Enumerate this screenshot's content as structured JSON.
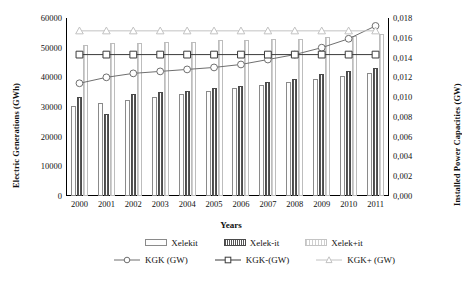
{
  "chart_data": {
    "type": "bar",
    "title": "",
    "xlabel": "Years",
    "ylabel": "Electric Generations (GWh)",
    "y2label": "Installed Power Capacities (GW)",
    "categories": [
      "2000",
      "2001",
      "2002",
      "2003",
      "2004",
      "2005",
      "2006",
      "2007",
      "2008",
      "2009",
      "2010",
      "2011"
    ],
    "ylim": [
      0,
      60000
    ],
    "y2lim": [
      0,
      0.018
    ],
    "y_ticks": [
      "0",
      "10000",
      "20000",
      "30000",
      "40000",
      "50000",
      "60000"
    ],
    "y2_ticks": [
      "0,000",
      "0,002",
      "0,004",
      "0,006",
      "0,008",
      "0,010",
      "0,012",
      "0,014",
      "0,016",
      "0,018"
    ],
    "grid": false,
    "legend_position": "bottom",
    "decimal_separator": ",",
    "bar_series": [
      {
        "name": "Xelekit",
        "axis": "left",
        "fill": "speckled",
        "values": [
          30500,
          31500,
          32500,
          33500,
          34500,
          35500,
          36500,
          37500,
          38500,
          39500,
          40500,
          41500
        ]
      },
      {
        "name": "Xelek-it",
        "axis": "left",
        "fill": "dark-hatch",
        "values": [
          33500,
          27500,
          34500,
          35000,
          35500,
          36500,
          37000,
          38500,
          39500,
          41000,
          42000,
          43000
        ]
      },
      {
        "name": "Xelek+it",
        "axis": "left",
        "fill": "light-hatch",
        "values": [
          51000,
          51500,
          51500,
          52000,
          52000,
          52500,
          52500,
          53000,
          53000,
          53500,
          54000,
          54500
        ]
      }
    ],
    "line_series": [
      {
        "name": "KGK (GW)",
        "axis": "right",
        "marker": "circle",
        "color": "#6f6f6f",
        "values": [
          0.0114,
          0.012,
          0.0124,
          0.0126,
          0.0128,
          0.013,
          0.0133,
          0.0138,
          0.0143,
          0.015,
          0.0159,
          0.0172
        ]
      },
      {
        "name": "KGK-(GW)",
        "axis": "right",
        "marker": "square",
        "color": "#3b3b3b",
        "values": [
          0.0143,
          0.0143,
          0.0143,
          0.0143,
          0.0143,
          0.0143,
          0.0143,
          0.0143,
          0.0143,
          0.0143,
          0.0143,
          0.0143
        ]
      },
      {
        "name": "KGK+ (GW)",
        "axis": "right",
        "marker": "triangle",
        "color": "#c2c2c2",
        "values": [
          0.0167,
          0.0167,
          0.0167,
          0.0167,
          0.0167,
          0.0167,
          0.0167,
          0.0167,
          0.0167,
          0.0167,
          0.0167,
          0.0167
        ]
      }
    ]
  },
  "legend": {
    "row1": [
      {
        "label": "Xelekit",
        "swatch": "speckled-swatch"
      },
      {
        "label": "Xelek-it",
        "swatch": "dark-hatch-swatch"
      },
      {
        "label": "Xelek+it",
        "swatch": "light-hatch-swatch"
      }
    ],
    "row2": [
      {
        "label": "KGK (GW)",
        "marker": "circle-marker"
      },
      {
        "label": "KGK-(GW)",
        "marker": "square-marker"
      },
      {
        "label": "KGK+ (GW)",
        "marker": "triangle-marker"
      }
    ]
  }
}
